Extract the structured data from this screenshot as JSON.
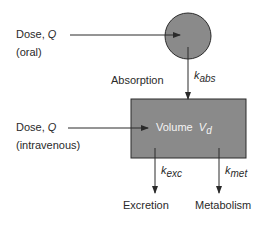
{
  "diagram": {
    "title": "",
    "colors": {
      "compartment_fill": "#8a8a8a",
      "stroke": "#2a2a2a",
      "background": "#ffffff"
    },
    "nodes": {
      "gut": {
        "shape": "circle",
        "label": ""
      },
      "central": {
        "shape": "rectangle",
        "label": "Volume",
        "symbol": "V",
        "symbol_sub": "d"
      }
    },
    "inputs": {
      "oral": {
        "line1": "Dose, ",
        "q": "Q",
        "line2": "(oral)"
      },
      "iv": {
        "line1": "Dose, ",
        "q": "Q",
        "line2": "(intravenous)"
      }
    },
    "edges": {
      "absorption": {
        "label": "Absorption",
        "k": "k",
        "k_sub": "abs"
      },
      "excretion": {
        "label": "Excretion",
        "k": "k",
        "k_sub": "exc"
      },
      "metabolism": {
        "label": "Metabolism",
        "k": "k",
        "k_sub": "met"
      }
    }
  }
}
